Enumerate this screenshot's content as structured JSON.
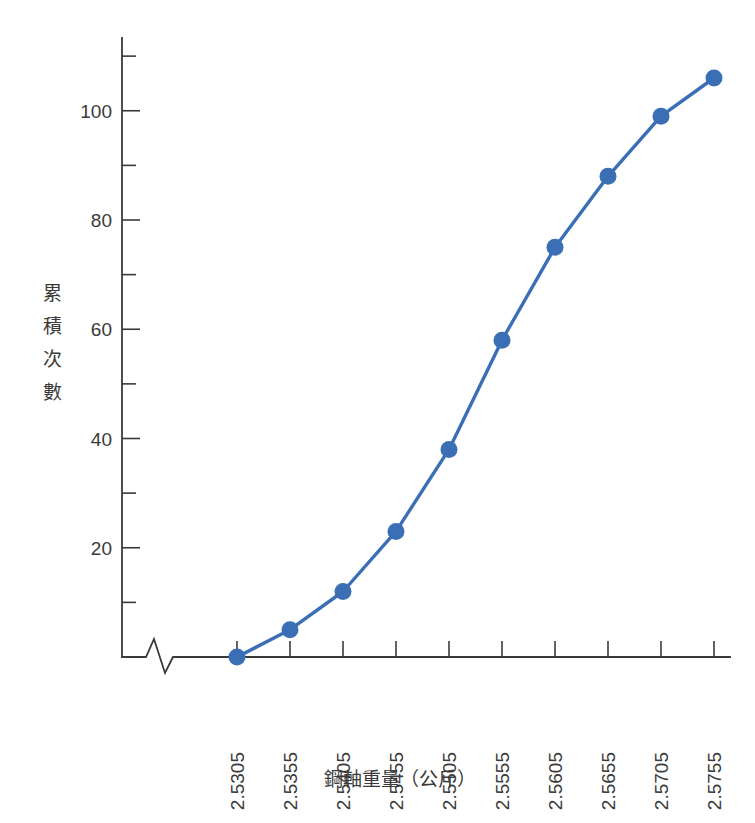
{
  "chart_data": {
    "type": "line",
    "title": "",
    "subtitle": "",
    "xlabel": "鋼軸重量（公斤）",
    "ylabel": "累積次數",
    "categories": [
      "2.5305",
      "2.5355",
      "2.5405",
      "2.5455",
      "2.5505",
      "2.5555",
      "2.5605",
      "2.5655",
      "2.5705",
      "2.5755"
    ],
    "values": [
      0,
      5,
      12,
      23,
      38,
      58,
      75,
      88,
      99,
      106
    ],
    "series": [
      {
        "name": "累積次數",
        "values": [
          0,
          5,
          12,
          23,
          38,
          58,
          75,
          88,
          99,
          106
        ],
        "color": "#3A6FB5",
        "marker": "circle"
      }
    ],
    "ylim": [
      0,
      112
    ],
    "y_major_ticks": [
      20,
      40,
      60,
      80,
      100
    ],
    "y_minor_ticks": [
      10,
      30,
      50,
      70,
      90,
      110
    ],
    "y_tick_labels": [
      "20",
      "40",
      "60",
      "80",
      "100"
    ],
    "grid": false,
    "legend": "none",
    "x_axis_break": true,
    "annotations": []
  },
  "colors": {
    "series": "#3A6FB5",
    "axis": "#3A3A3A",
    "background": "#FFFFFF"
  },
  "axis": {
    "y_title_chars": [
      "累",
      "積",
      "次",
      "數"
    ],
    "x_title": "鋼軸重量（公斤）"
  }
}
